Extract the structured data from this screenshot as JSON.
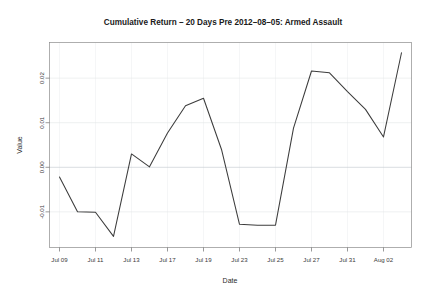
{
  "chart_data": {
    "type": "line",
    "title": "Cumulative Return – 20 Days Pre 2012–08–05: Armed Assault",
    "xlabel": "Date",
    "ylabel": "Value",
    "grid": true,
    "legend": false,
    "legend_position": "none",
    "line_color": "#3c3c3c",
    "x_tick_labels": [
      "Jul 09",
      "Jul 11",
      "Jul 13",
      "Jul 17",
      "Jul 19",
      "Jul 23",
      "Jul 25",
      "Jul 27",
      "Jul 31",
      "Aug 02"
    ],
    "y_tick_labels": [
      "-0.01",
      "0.00",
      "0.01",
      "0.02"
    ],
    "y_tick_values": [
      -0.01,
      0.0,
      0.01,
      0.02
    ],
    "ylim": [
      -0.018,
      0.028
    ],
    "xlim": [
      0,
      19
    ],
    "x": [
      "Jul 09",
      "Jul 10",
      "Jul 11",
      "Jul 12",
      "Jul 13",
      "Jul 16",
      "Jul 17",
      "Jul 18",
      "Jul 19",
      "Jul 20",
      "Jul 23",
      "Jul 24",
      "Jul 25",
      "Jul 26",
      "Jul 27",
      "Jul 30",
      "Jul 31",
      "Aug 01",
      "Aug 02",
      "Aug 03"
    ],
    "values": [
      -0.0022,
      -0.01,
      -0.0101,
      -0.0155,
      0.003,
      0.0001,
      0.0077,
      0.0138,
      0.0155,
      0.004,
      -0.0128,
      -0.013,
      -0.013,
      0.0088,
      0.0216,
      0.0212,
      0.017,
      0.013,
      0.0068,
      0.0257
    ]
  }
}
